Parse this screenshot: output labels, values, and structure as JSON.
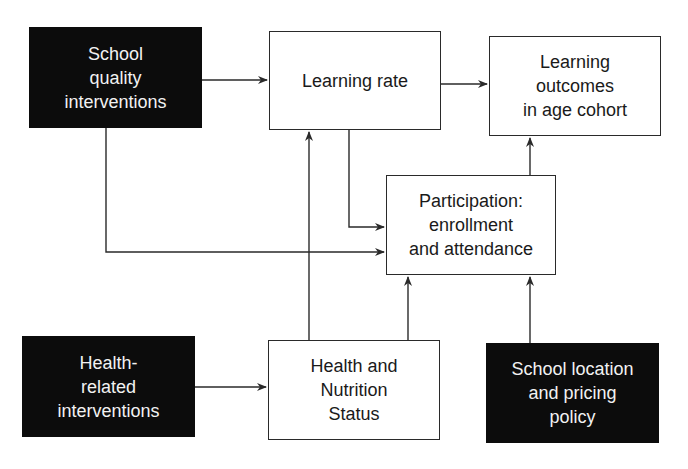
{
  "diagram": {
    "nodes": {
      "school_quality": {
        "label": "School\nquality\ninterventions",
        "style": "dark"
      },
      "learning_rate": {
        "label": "Learning rate",
        "style": "light"
      },
      "learning_outcomes": {
        "label": "Learning\noutcomes\nin age cohort",
        "style": "light"
      },
      "participation": {
        "label": "Participation:\nenrollment\nand attendance",
        "style": "light"
      },
      "health_interventions": {
        "label": "Health-\nrelated\ninterventions",
        "style": "dark"
      },
      "health_status": {
        "label": "Health and\nNutrition\nStatus",
        "style": "light"
      },
      "school_location": {
        "label": "School location\nand pricing\npolicy",
        "style": "dark"
      }
    },
    "edges": [
      {
        "from": "school_quality",
        "to": "learning_rate"
      },
      {
        "from": "school_quality",
        "to": "participation"
      },
      {
        "from": "learning_rate",
        "to": "learning_outcomes"
      },
      {
        "from": "learning_rate",
        "to": "participation"
      },
      {
        "from": "participation",
        "to": "learning_outcomes"
      },
      {
        "from": "health_interventions",
        "to": "health_status"
      },
      {
        "from": "health_status",
        "to": "learning_rate"
      },
      {
        "from": "health_status",
        "to": "participation"
      },
      {
        "from": "school_location",
        "to": "participation"
      }
    ],
    "colors": {
      "dark_fill": "#0c0c0c",
      "dark_text": "#f2f2f2",
      "line": "#2a2a2a"
    }
  }
}
